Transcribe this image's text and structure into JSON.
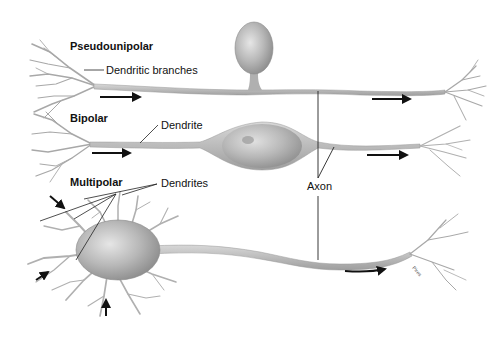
{
  "diagram": {
    "type": "anatomical-illustration",
    "neurons": [
      {
        "id": "pseudounipolar",
        "title": "Pseudounipolar",
        "labels": [
          "Dendritic branches"
        ],
        "signal_direction": "left-to-right"
      },
      {
        "id": "bipolar",
        "title": "Bipolar",
        "labels": [
          "Dendrite"
        ],
        "signal_direction": "left-to-right"
      },
      {
        "id": "multipolar",
        "title": "Multipolar",
        "labels": [
          "Dendrites"
        ],
        "signal_direction": "left-to-right"
      }
    ],
    "shared_labels": {
      "axon": "Axon"
    },
    "artist_signature": "Pires"
  },
  "labels": {
    "pseudounipolar_title": "Pseudounipolar",
    "dendritic_branches": "Dendritic branches",
    "bipolar_title": "Bipolar",
    "dendrite": "Dendrite",
    "multipolar_title": "Multipolar",
    "dendrites": "Dendrites",
    "axon": "Axon",
    "signature": "Pires"
  },
  "colors": {
    "background": "#ffffff",
    "neuron_fill": "#c9c9c9",
    "neuron_shade": "#9a9a9a",
    "leader_line": "#222222",
    "arrow": "#111111",
    "label_text": "#111111"
  }
}
